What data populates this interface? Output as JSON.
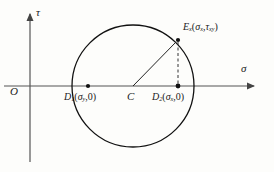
{
  "figure": {
    "kind": "mohr-circle-diagram",
    "background_color": "#fdfdfb",
    "stroke_color": "#1a1a1a",
    "axis_color": "#555555"
  },
  "axes": {
    "horizontal": {
      "name": "sigma-axis",
      "label": "σ",
      "y": 86,
      "x_start": 4,
      "x_end": 262
    },
    "vertical": {
      "name": "tau-axis",
      "label": "τ",
      "x": 30,
      "y_start": 162,
      "y_end": 12
    },
    "origin": {
      "label": "O",
      "x": 30,
      "y": 86
    }
  },
  "circle": {
    "center_x": 133,
    "center_y": 86,
    "radius": 61,
    "center_label": "C",
    "center_dot": false
  },
  "points": [
    {
      "id": "d1",
      "label_main": "D",
      "label_sub": "1",
      "coord_open": "(",
      "coord_x_main": "σ",
      "coord_x_sub": "y",
      "coord_comma": ",",
      "coord_y": "0",
      "coord_close": ")",
      "x": 88,
      "y": 86,
      "dot": true
    },
    {
      "id": "d2",
      "label_main": "D",
      "label_sub": "2",
      "coord_open": "(",
      "coord_x_main": "σ",
      "coord_x_sub": "x",
      "coord_comma": ",",
      "coord_y": "0",
      "coord_close": ")",
      "x": 178,
      "y": 86,
      "dot": true
    },
    {
      "id": "e",
      "label_main": "E",
      "label_sub": "x",
      "coord_open": "(",
      "coord_x_main": "σ",
      "coord_x_sub": "x",
      "coord_comma": ",",
      "coord_y_main": "τ",
      "coord_y_sub": "xy",
      "coord_close": ")",
      "x": 178,
      "y": 40,
      "dot": true
    }
  ],
  "segments": [
    {
      "id": "radius-line",
      "style": "solid",
      "from_x": 133,
      "from_y": 86,
      "to_x": 178,
      "to_y": 40
    },
    {
      "id": "drop-line",
      "style": "dashed",
      "from_x": 178,
      "from_y": 40,
      "to_x": 178,
      "to_y": 86
    }
  ]
}
